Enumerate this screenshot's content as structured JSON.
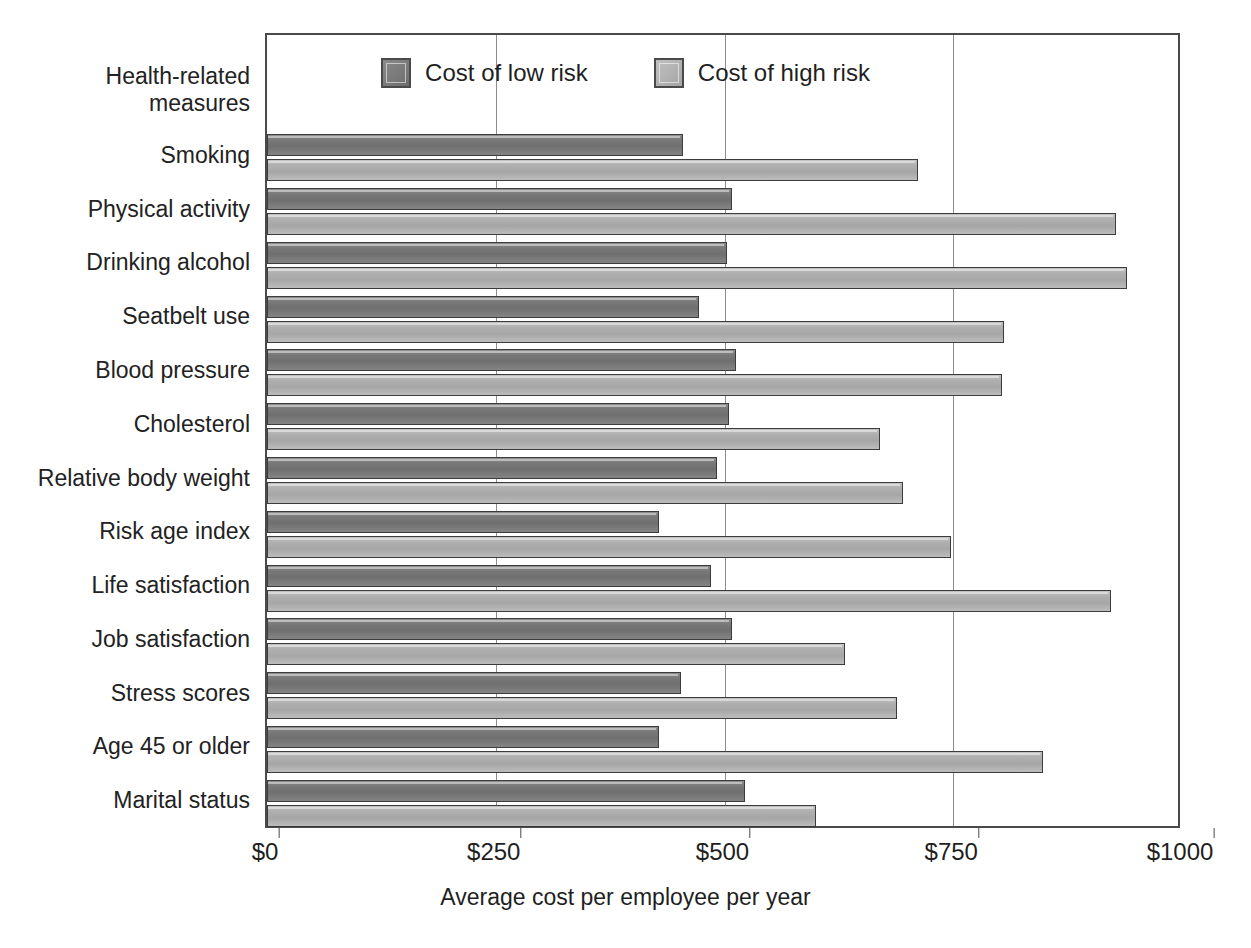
{
  "axis": {
    "y_header": "Health-related\nmeasures",
    "x_title": "Average cost per employee per year",
    "x_ticks": [
      "$0",
      "$250",
      "$500",
      "$750",
      "$1000"
    ]
  },
  "legend": {
    "items": [
      {
        "label": "Cost of low risk",
        "color": "#787878",
        "key": "low"
      },
      {
        "label": "Cost of high risk",
        "color": "#b0b0b0",
        "key": "high"
      }
    ]
  },
  "chart_data": {
    "type": "bar",
    "orientation": "horizontal",
    "title": "",
    "xlabel": "Average cost per employee per year",
    "ylabel": "Health-related measures",
    "xlim": [
      0,
      1000
    ],
    "xticks": [
      0,
      250,
      500,
      750,
      1000
    ],
    "xtick_labels": [
      "$0",
      "$250",
      "$500",
      "$750",
      "$1000"
    ],
    "grid": true,
    "legend_position": "top-center",
    "categories": [
      "Smoking",
      "Physical activity",
      "Drinking alcohol",
      "Seatbelt use",
      "Blood pressure",
      "Cholesterol",
      "Relative body weight",
      "Risk age index",
      "Life satisfaction",
      "Job satisfaction",
      "Stress scores",
      "Age 45 or older",
      "Marital status"
    ],
    "series": [
      {
        "name": "Cost of low risk",
        "color": "#787878",
        "values": [
          455,
          508,
          503,
          472,
          513,
          505,
          492,
          428,
          485,
          508,
          452,
          428,
          522
        ]
      },
      {
        "name": "Cost of high risk",
        "color": "#b0b0b0",
        "values": [
          712,
          928,
          940,
          805,
          803,
          670,
          695,
          748,
          922,
          632,
          688,
          848,
          600
        ]
      }
    ]
  }
}
